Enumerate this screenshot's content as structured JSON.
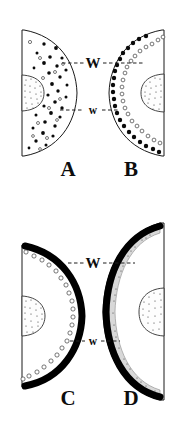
{
  "figure": {
    "background_color": "#ffffff",
    "ink_color": "#0d0d0d",
    "width": 186,
    "height": 428,
    "panels": [
      {
        "id": "A",
        "label": "A",
        "label_x": 68,
        "label_y": 170,
        "orientation": "right-facing",
        "flat_edge": "left",
        "outer_border": "thin",
        "dot_pattern": "scattered-throughout",
        "dot_color": "#0a0a0a",
        "organ_present": true,
        "organ_position": "flat-edge-center"
      },
      {
        "id": "B",
        "label": "B",
        "label_x": 131,
        "label_y": 170,
        "orientation": "left-facing",
        "flat_edge": "right",
        "outer_border": "thin",
        "dot_pattern": "two-concentric-arcs",
        "dot_color": "#0a0a0a",
        "organ_present": true,
        "organ_position": "flat-edge-center"
      },
      {
        "id": "C",
        "label": "C",
        "label_x": 68,
        "label_y": 399,
        "orientation": "right-facing",
        "flat_edge": "left",
        "outer_border": "thick-black-arc",
        "dot_pattern": "single-open-arc",
        "dot_color": "#ffffff",
        "organ_present": true,
        "organ_position": "flat-edge-center"
      },
      {
        "id": "D",
        "label": "D",
        "label_x": 131,
        "label_y": 399,
        "orientation": "left-facing",
        "flat_edge": "right",
        "outer_border": "thick-black-arc",
        "dot_pattern": "continuous-stippled-band",
        "dot_color": "#d8d8d8",
        "organ_present": true,
        "organ_position": "flat-edge-center"
      }
    ],
    "measurements": [
      {
        "id": "top-W",
        "label": "W",
        "size": "large",
        "label_x": 93,
        "label_y": 65,
        "row": "top",
        "connects": [
          "A",
          "B"
        ]
      },
      {
        "id": "top-w",
        "label": "w",
        "size": "small",
        "label_x": 93,
        "label_y": 113,
        "row": "top",
        "connects": [
          "A",
          "B"
        ]
      },
      {
        "id": "bottom-W",
        "label": "W",
        "size": "large",
        "label_x": 93,
        "label_y": 265,
        "row": "bottom",
        "connects": [
          "C",
          "D"
        ]
      },
      {
        "id": "bottom-w",
        "label": "w",
        "size": "small",
        "label_x": 93,
        "label_y": 343,
        "row": "bottom",
        "connects": [
          "C",
          "D"
        ]
      }
    ]
  }
}
